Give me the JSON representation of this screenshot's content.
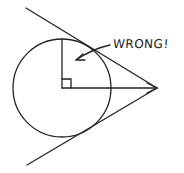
{
  "diagram": {
    "annotation": "WRONG!",
    "stroke_color": "#222222",
    "background": "#ffffff",
    "elements": [
      "circle",
      "vertical radius",
      "horizontal radius to external point",
      "right-angle marker at center",
      "upper tangent-like line through arrow tip",
      "lower tangent line through arrow tip",
      "arrowhead at external point",
      "curved arrow pointing from label into the circle"
    ]
  }
}
